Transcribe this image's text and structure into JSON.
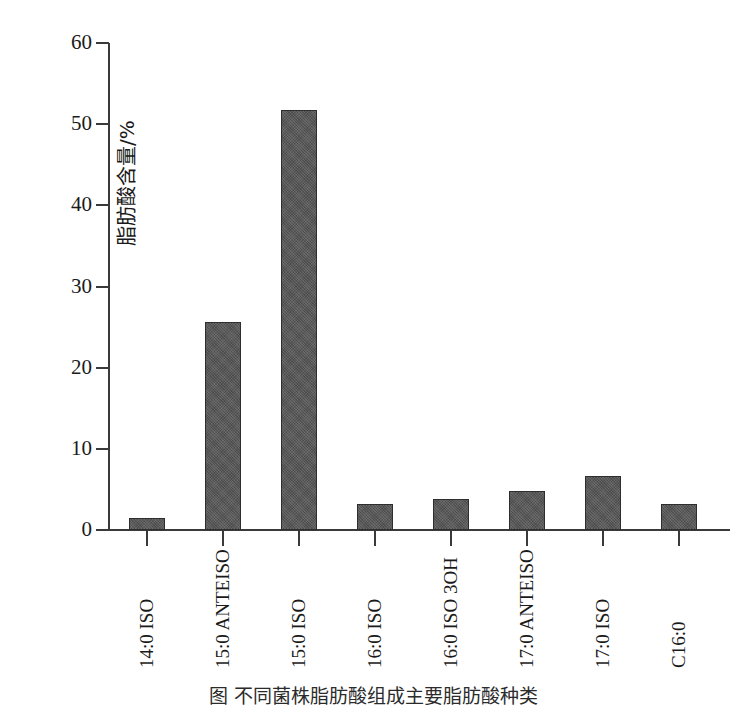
{
  "chart_data": {
    "type": "bar",
    "title": "",
    "xlabel": "",
    "ylabel": "脂肪酸含量/%",
    "ylim": [
      0,
      60
    ],
    "yticks": [
      0,
      10,
      20,
      30,
      40,
      50,
      60
    ],
    "ytick_labels": [
      "0",
      "10",
      "20",
      "30",
      "40",
      "50",
      "60"
    ],
    "grid": false,
    "legend": null,
    "bar_color": "#565656",
    "bar_edge_color": "#2e2e2e",
    "axis_color": "#3a3a3a",
    "categories": [
      "14:0 ISO",
      "15:0 ANTEISO",
      "15:0 ISO",
      "16:0 ISO",
      "16:0 ISO 3OH",
      "17:0 ANTEISO",
      "17:0 ISO",
      "C16:0"
    ],
    "values": [
      1.5,
      25.6,
      51.7,
      3.2,
      3.8,
      4.8,
      6.7,
      3.2
    ]
  },
  "caption": {
    "text": "图  不同菌株脂肪酸组成主要脂肪酸种类"
  }
}
